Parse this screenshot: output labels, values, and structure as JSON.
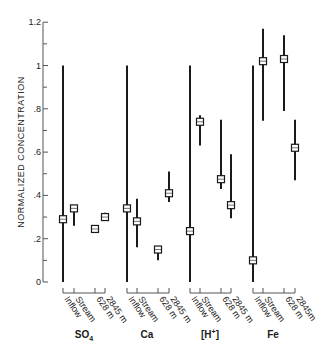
{
  "chart_data": {
    "type": "scatter",
    "subtype": "range-errorbar",
    "title": "",
    "xlabel": "",
    "ylabel": "NORMALIZED CONCENTRATION",
    "ylim": [
      0,
      1.2
    ],
    "yticks": [
      0,
      0.2,
      0.4,
      0.6,
      0.8,
      1.0,
      1.2
    ],
    "ytick_labels": [
      "0",
      ".2",
      ".4",
      ".6",
      ".8",
      "1",
      "1.2"
    ],
    "grid": false,
    "legend": null,
    "categories": [
      "Inflow",
      "Stream",
      "628 m",
      "2845 m"
    ],
    "groups": [
      {
        "name": "SO4",
        "label_main": "SO",
        "label_sub": "4",
        "tick_labels": [
          "Inflow",
          "Stream",
          "628 m",
          "2845 m"
        ],
        "points": [
          {
            "category": "Inflow",
            "value": 0.29,
            "low": 0.0,
            "high": 1.0
          },
          {
            "category": "Stream",
            "value": 0.34,
            "low": 0.26,
            "high": 0.35
          },
          {
            "category": "628 m",
            "value": 0.245,
            "low": 0.23,
            "high": 0.255
          },
          {
            "category": "2845 m",
            "value": 0.3,
            "low": 0.285,
            "high": 0.32
          }
        ]
      },
      {
        "name": "Ca",
        "label_main": "Ca",
        "label_sub": "",
        "tick_labels": [
          "Inflow",
          "Stream",
          "628 m",
          "2845 m"
        ],
        "points": [
          {
            "category": "Inflow",
            "value": 0.34,
            "low": 0.0,
            "high": 1.0
          },
          {
            "category": "Stream",
            "value": 0.28,
            "low": 0.16,
            "high": 0.385
          },
          {
            "category": "628 m",
            "value": 0.15,
            "low": 0.1,
            "high": 0.16
          },
          {
            "category": "2845 m",
            "value": 0.41,
            "low": 0.37,
            "high": 0.51
          }
        ]
      },
      {
        "name": "[H+]",
        "label_main": "[H",
        "label_sup": "+",
        "label_end": "]",
        "tick_labels": [
          "Inflow",
          "Stream",
          "628 m",
          "2845 m"
        ],
        "points": [
          {
            "category": "Inflow",
            "value": 0.235,
            "low": 0.0,
            "high": 1.0
          },
          {
            "category": "Stream",
            "value": 0.74,
            "low": 0.63,
            "high": 0.77
          },
          {
            "category": "628 m",
            "value": 0.475,
            "low": 0.43,
            "high": 0.75
          },
          {
            "category": "2845 m",
            "value": 0.355,
            "low": 0.295,
            "high": 0.59
          }
        ]
      },
      {
        "name": "Fe",
        "label_main": "Fe",
        "label_sub": "",
        "tick_labels": [
          "Inflow",
          "Stream",
          "628 m",
          "2845m"
        ],
        "points": [
          {
            "category": "Inflow",
            "value": 0.1,
            "low": 0.0,
            "high": 1.0
          },
          {
            "category": "Stream",
            "value": 1.02,
            "low": 0.745,
            "high": 1.17
          },
          {
            "category": "628 m",
            "value": 1.03,
            "low": 0.79,
            "high": 1.14
          },
          {
            "category": "2845 m",
            "value": 0.62,
            "low": 0.47,
            "high": 0.75
          }
        ]
      }
    ]
  }
}
